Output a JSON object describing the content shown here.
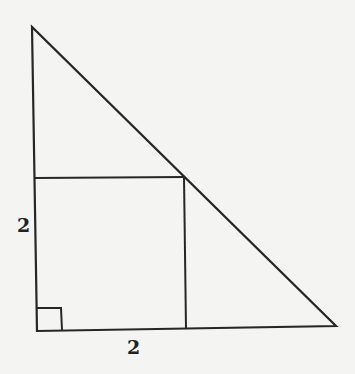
{
  "diagram": {
    "stroke_color": "#262626",
    "background_color": "#f4f4f2",
    "triangle": {
      "vertices": {
        "top": [
          32,
          27
        ],
        "right_angle": [
          37,
          331
        ],
        "right": [
          336,
          326
        ]
      }
    },
    "square": {
      "top_left": [
        35,
        178
      ],
      "top_right": [
        184,
        177
      ],
      "bottom_right": [
        186,
        329
      ],
      "bottom_left": [
        37,
        331
      ]
    },
    "right_angle_marker": {
      "size": 24
    },
    "labels": {
      "left_side": "2",
      "bottom_side": "2"
    }
  }
}
